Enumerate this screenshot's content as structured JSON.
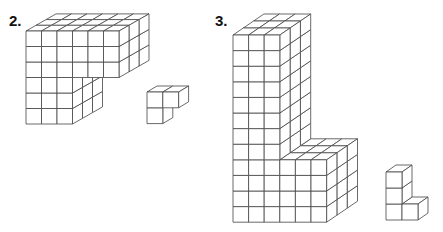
{
  "problems": [
    {
      "label": "2.",
      "label_pos": [
        9,
        13
      ],
      "figure": {
        "origin": [
          26,
          31
        ],
        "cell": 15.5,
        "depth_vec": [
          10,
          -5.7
        ],
        "depth_cells": 3,
        "description": "Large block: top 3 rows × 6 columns, lower 3 rows × 3 columns, 3 cubes deep",
        "columns": [
          6,
          6,
          6,
          3,
          3,
          3
        ]
      },
      "piece": {
        "origin": [
          147,
          92
        ],
        "cell": 15.8,
        "depth_vec": [
          10,
          -6
        ],
        "depth_cells": 1,
        "description": "Small L-shaped piece: 2 cubes top row, 1 cube bottom row",
        "columns": [
          2,
          1
        ]
      }
    },
    {
      "label": "3.",
      "label_pos": [
        215,
        13
      ],
      "figure": {
        "origin": [
          233,
          35
        ],
        "cell": 15.6,
        "depth_vec": [
          10.3,
          -7
        ],
        "depth_cells": 3,
        "description": "Tall L-shaped block: 3 columns × 12 rows tall, with a 6-column base 4 rows high, 3 cubes deep",
        "columns": [
          3,
          3,
          3,
          3,
          3,
          3,
          3,
          3,
          6,
          6,
          6,
          6
        ]
      },
      "piece": {
        "origin": [
          386,
          172
        ],
        "cell": 16,
        "depth_vec": [
          10,
          -7
        ],
        "depth_cells": 1,
        "description": "Small L-shaped piece: 3 cubes stacked with 1 cube beside the bottom",
        "columns": [
          1,
          1,
          2
        ]
      }
    }
  ],
  "colors": {
    "stroke": "#444444",
    "face": "#ffffff",
    "label": "#111111"
  }
}
